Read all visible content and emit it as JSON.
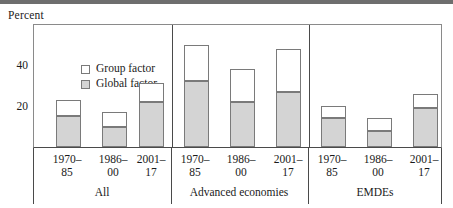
{
  "figure": {
    "unit_label": "Percent"
  },
  "legend": {
    "position": "top-left-inside",
    "items": [
      {
        "label": "Group factor",
        "swatch": "white-square-icon",
        "color": "#ffffff"
      },
      {
        "label": "Global factor",
        "swatch": "gray-square-icon",
        "color": "#d4d4d4"
      }
    ]
  },
  "axis": {
    "y_ticks": [
      {
        "value": 20,
        "label": "20"
      },
      {
        "value": 40,
        "label": "40"
      }
    ],
    "y_min": 0,
    "y_max": 57
  },
  "chart_data": {
    "type": "bar",
    "title": "",
    "subtitle": "",
    "xlabel": "",
    "ylabel": "Percent",
    "ylim": [
      0,
      57
    ],
    "grid": false,
    "stacked": true,
    "legend_position": "upper left",
    "categories": [
      "1970–85",
      "1986–00",
      "2001–17",
      "1970–85",
      "1986–00",
      "2001–17",
      "1970–85",
      "1986–00",
      "2001–17"
    ],
    "groups": [
      {
        "name": "All",
        "categories": [
          "1970–85",
          "1986–00",
          "2001–17"
        ]
      },
      {
        "name": "Advanced economies",
        "categories": [
          "1970–85",
          "1986–00",
          "2001–17"
        ]
      },
      {
        "name": "EMDEs",
        "categories": [
          "1970–85",
          "1986–00",
          "2001–17"
        ]
      }
    ],
    "series": [
      {
        "name": "Global factor",
        "color": "#d4d4d4",
        "values": [
          15,
          10,
          22,
          32,
          22,
          27,
          14,
          8,
          19
        ]
      },
      {
        "name": "Group factor",
        "color": "#ffffff",
        "values": [
          8,
          7,
          9,
          18,
          16,
          21,
          6,
          6,
          7
        ]
      }
    ],
    "totals": [
      23,
      17,
      31,
      50,
      38,
      48,
      20,
      14,
      26
    ]
  },
  "bars": [
    {
      "id": "all-1970-85",
      "group": "All",
      "period": "1970–85",
      "global": 15,
      "group_factor": 8,
      "total": 23
    },
    {
      "id": "all-1986-00",
      "group": "All",
      "period": "1986–00",
      "global": 10,
      "group_factor": 7,
      "total": 17
    },
    {
      "id": "all-2001-17",
      "group": "All",
      "period": "2001–17",
      "global": 22,
      "group_factor": 9,
      "total": 31
    },
    {
      "id": "ae-1970-85",
      "group": "Advanced economies",
      "period": "1970–85",
      "global": 32,
      "group_factor": 18,
      "total": 50
    },
    {
      "id": "ae-1986-00",
      "group": "Advanced economies",
      "period": "1986–00",
      "global": 22,
      "group_factor": 16,
      "total": 38
    },
    {
      "id": "ae-2001-17",
      "group": "Advanced economies",
      "period": "2001–17",
      "global": 27,
      "group_factor": 21,
      "total": 48
    },
    {
      "id": "emde-1970-85",
      "group": "EMDEs",
      "period": "1970–85",
      "global": 14,
      "group_factor": 6,
      "total": 20
    },
    {
      "id": "emde-1986-00",
      "group": "EMDEs",
      "period": "1986–00",
      "global": 8,
      "group_factor": 6,
      "total": 14
    },
    {
      "id": "emde-2001-17",
      "group": "EMDEs",
      "period": "2001–17",
      "global": 19,
      "group_factor": 7,
      "total": 26
    }
  ],
  "x_labels": [
    {
      "line1": "1970–",
      "line2": "85"
    },
    {
      "line1": "1986–",
      "line2": "00"
    },
    {
      "line1": "2001–",
      "line2": "17"
    },
    {
      "line1": "1970–",
      "line2": "85"
    },
    {
      "line1": "1986–",
      "line2": "00"
    },
    {
      "line1": "2001–",
      "line2": "17"
    },
    {
      "line1": "1970–",
      "line2": "85"
    },
    {
      "line1": "1986–",
      "line2": "00"
    },
    {
      "line1": "2001–",
      "line2": "17"
    }
  ],
  "group_labels": [
    "All",
    "Advanced economies",
    "EMDEs"
  ],
  "colors": {
    "global_factor": "#d4d4d4",
    "group_factor": "#ffffff",
    "bar_outline": "#7a7a7a",
    "axis": "#4a4a4a",
    "top_rule": "#6e6e6e",
    "text": "#1a1a1a"
  }
}
